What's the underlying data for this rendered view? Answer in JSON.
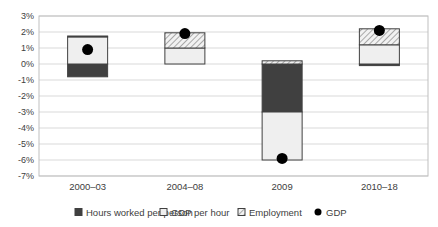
{
  "chart_data": {
    "type": "bar",
    "subtype": "stacked-bar-with-markers",
    "title": "",
    "xlabel": "",
    "ylabel": "",
    "ylim": [
      -7,
      3
    ],
    "yticks": [
      "3%",
      "2%",
      "1%",
      "0%",
      "-1%",
      "-2%",
      "-3%",
      "-4%",
      "-5%",
      "-6%",
      "-7%"
    ],
    "ytick_values": [
      3,
      2,
      1,
      0,
      -1,
      -2,
      -3,
      -4,
      -5,
      -6,
      -7
    ],
    "grid": true,
    "legend_position": "bottom",
    "categories": [
      "2000–03",
      "2004–08",
      "2009",
      "2010–18"
    ],
    "series": [
      {
        "name": "Hours worked per person",
        "kind": "bar",
        "color": "#404040",
        "values": [
          -0.8,
          0.0,
          -3.0,
          -0.1
        ]
      },
      {
        "name": "GDP per hour",
        "kind": "bar",
        "color": "#efefef",
        "values": [
          1.7,
          1.0,
          -3.0,
          1.2
        ]
      },
      {
        "name": "Employment",
        "kind": "bar",
        "pattern": "hatched",
        "color": "#bfbfbf",
        "values": [
          0.05,
          0.95,
          0.2,
          1.0
        ]
      },
      {
        "name": "GDP",
        "kind": "marker",
        "color": "#000000",
        "values": [
          0.9,
          1.9,
          -5.9,
          2.1
        ]
      }
    ]
  },
  "legend": {
    "items": [
      {
        "label": "Hours worked per person",
        "icon": "dark-square"
      },
      {
        "label": "GDP per hour",
        "icon": "light-square"
      },
      {
        "label": "Employment",
        "icon": "hatched-square"
      },
      {
        "label": "GDP",
        "icon": "black-dot"
      }
    ]
  }
}
